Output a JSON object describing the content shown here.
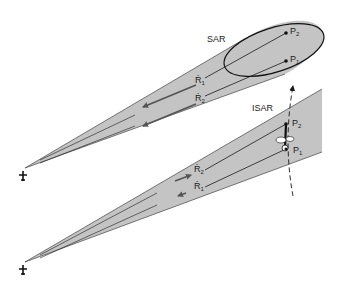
{
  "diagram": {
    "type": "radar-geometry-comparison",
    "colors": {
      "beam_fill": "#c4c4c4",
      "line": "#1a1a1a",
      "arrow": "#555555",
      "background": "#ffffff"
    },
    "panels": [
      {
        "id": "sar",
        "title": "SAR",
        "points": [
          {
            "label": "P",
            "sub": "2"
          },
          {
            "label": "P",
            "sub": "1"
          }
        ],
        "range_rates": [
          {
            "label": "Ṙ",
            "sub": "1",
            "direction": "toward-radar"
          },
          {
            "label": "Ṙ",
            "sub": "2",
            "direction": "toward-radar"
          }
        ],
        "footprint": "ellipse",
        "platform_icon": "airplane-icon"
      },
      {
        "id": "isar",
        "title": "ISAR",
        "points": [
          {
            "label": "P",
            "sub": "2"
          },
          {
            "label": "P",
            "sub": "1"
          }
        ],
        "range_rates": [
          {
            "label": "Ṙ",
            "sub": "2",
            "direction": "away-from-radar"
          },
          {
            "label": "Ṙ",
            "sub": "1",
            "direction": "toward-radar"
          }
        ],
        "target": "rotating-aircraft",
        "target_path": "dashed-arc",
        "platform_icon": "airplane-icon"
      }
    ]
  }
}
